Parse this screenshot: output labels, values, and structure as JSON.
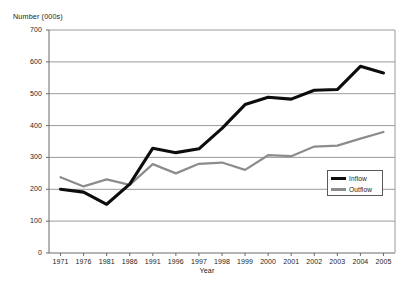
{
  "chart_data": {
    "type": "line",
    "title": "",
    "xlabel": "Year",
    "ylabel": "Number (000s)",
    "ylim": [
      0,
      700
    ],
    "y_ticks": [
      0,
      100,
      200,
      300,
      400,
      500,
      600,
      700
    ],
    "grid": "horizontal",
    "legend_position": "inside-right",
    "categories": [
      "1971",
      "1976",
      "1981",
      "1986",
      "1991",
      "1996",
      "1997",
      "1998",
      "1999",
      "2000",
      "2001",
      "2002",
      "2003",
      "2004",
      "2005"
    ],
    "series": [
      {
        "name": "Inflow",
        "color": "#0d0d0d",
        "values": [
          200,
          191,
          153,
          216,
          329,
          315,
          327,
          391,
          466,
          489,
          483,
          511,
          513,
          586,
          565
        ]
      },
      {
        "name": "Outflow",
        "color": "#8c8c8c",
        "values": [
          238,
          209,
          231,
          214,
          279,
          250,
          280,
          284,
          261,
          307,
          304,
          334,
          337,
          359,
          380
        ]
      }
    ]
  },
  "axis": {
    "y_title": "Number (000s)",
    "x_title": "Year",
    "y_tick_labels": [
      "700",
      "600",
      "500",
      "400",
      "300",
      "200",
      "100",
      "0"
    ],
    "x_tick_labels": [
      "1971",
      "1976",
      "1981",
      "1986",
      "1991",
      "1996",
      "1997",
      "1998",
      "1999",
      "2000",
      "2001",
      "2002",
      "2003",
      "2004",
      "2005"
    ]
  },
  "legend": {
    "items": [
      {
        "label": "Inflow",
        "color": "#0d0d0d"
      },
      {
        "label": "Outflow",
        "color": "#8c8c8c"
      }
    ]
  }
}
